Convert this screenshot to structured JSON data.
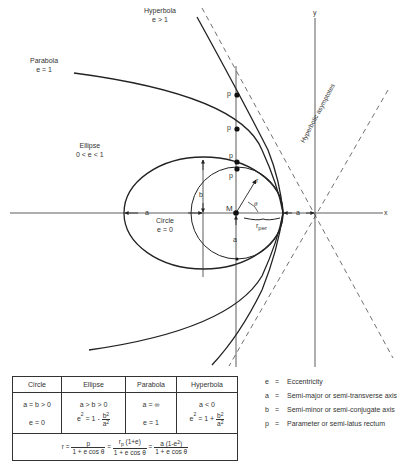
{
  "diagram": {
    "labels": {
      "hyperbola": {
        "name": "Hyperbola",
        "condition": "e > 1"
      },
      "parabola": {
        "name": "Parabola",
        "condition": "e = 1"
      },
      "ellipse": {
        "name": "Ellipse",
        "condition": "0 < e < 1"
      },
      "circle": {
        "name": "Circle",
        "condition": "e = 0"
      },
      "asymptotes": "Hyperbolic asymptotes",
      "x_axis": "x",
      "y_axis": "y",
      "focus": "M",
      "radius": "r",
      "angle": "θ",
      "r_per": "r",
      "r_per_sub": "per",
      "semi_major_left": "a",
      "semi_major_right": "a",
      "semi_minor": "b",
      "circle_radius": "a",
      "p_labels": [
        "p",
        "p",
        "p",
        "p"
      ]
    },
    "colors": {
      "line": "#222222",
      "background": "#ffffff"
    }
  },
  "table": {
    "headers": [
      "Circle",
      "Ellipse",
      "Parabola",
      "Hyperbola"
    ],
    "row_a": [
      "a = b > 0",
      "a > b > 0",
      "a = ∞",
      "a < 0"
    ],
    "row_e": {
      "circle": "e = 0",
      "ellipse_prefix": "e",
      "ellipse_mid": " = 1 - ",
      "parabola": "e = 1",
      "hyperbola_prefix": "e",
      "hyperbola_mid": " = 1 + ",
      "frac_num": "b",
      "frac_den": "a"
    },
    "formula": {
      "lhs": "r = ",
      "f1_num": "p",
      "den": "1 + e cos θ",
      "eq": " = ",
      "f2_num_r": "r",
      "f2_num_sub": "p",
      "f2_num_rest": " (1+e)",
      "f3_num": "a (1-e",
      "f3_num_end": ")"
    }
  },
  "legend": [
    {
      "symbol": "e",
      "definition": "Eccentricity"
    },
    {
      "symbol": "a",
      "definition": "Semi-major or semi-transverse axis"
    },
    {
      "symbol": "b",
      "definition": "Semi-minor or semi-conjugate axis"
    },
    {
      "symbol": "p",
      "definition": "Parameter or semi-latus rectum"
    }
  ],
  "legend_eq": "="
}
